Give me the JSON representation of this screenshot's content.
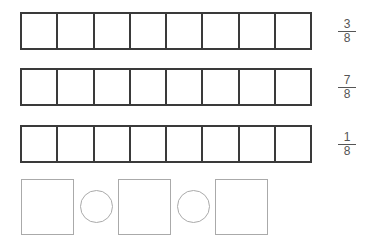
{
  "diagram": {
    "bars": [
      {
        "cells": 8,
        "fraction": {
          "numerator": "3",
          "denominator": "8"
        }
      },
      {
        "cells": 8,
        "fraction": {
          "numerator": "7",
          "denominator": "8"
        }
      },
      {
        "cells": 8,
        "fraction": {
          "numerator": "1",
          "denominator": "8"
        }
      }
    ],
    "answer_row": [
      "box",
      "circle",
      "box",
      "circle",
      "box"
    ],
    "colors": {
      "bar_stroke": "#3a3a3a",
      "answer_stroke": "#aaaaaa",
      "text": "#555555"
    }
  }
}
